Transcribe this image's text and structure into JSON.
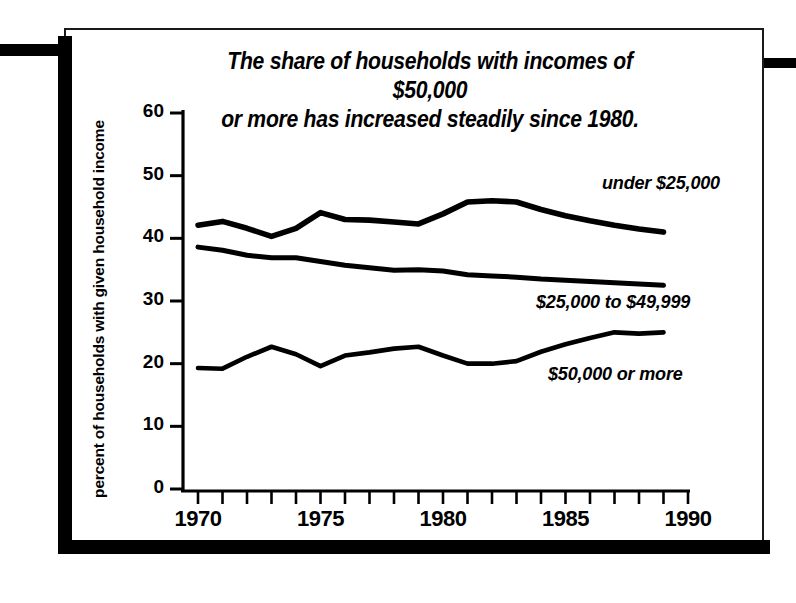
{
  "chart_data": {
    "type": "line",
    "title": "The share of households with incomes of $50,000 or more has increased steadily since 1980.",
    "title_line1": "The share of households with incomes of $50,000",
    "title_line2": "or more has increased steadily since 1980.",
    "xlabel": "",
    "ylabel": "percent of households with given household income",
    "xlim": [
      1970,
      1990
    ],
    "ylim": [
      0,
      60
    ],
    "grid": false,
    "legend_position": "inline-right",
    "x": [
      1970,
      1971,
      1972,
      1973,
      1974,
      1975,
      1976,
      1977,
      1978,
      1979,
      1980,
      1981,
      1982,
      1983,
      1984,
      1985,
      1986,
      1987,
      1988,
      1989
    ],
    "xtick_labels": [
      "1970",
      "1975",
      "1980",
      "1985",
      "1990"
    ],
    "xtick_values": [
      1970,
      1975,
      1980,
      1985,
      1990
    ],
    "ytick_labels": [
      "0",
      "10",
      "20",
      "30",
      "40",
      "50",
      "60"
    ],
    "ytick_values": [
      0,
      10,
      20,
      30,
      40,
      50,
      60
    ],
    "series": [
      {
        "name": "under $25,000",
        "label": "under $25,000",
        "color": "#000000",
        "values": [
          42.1,
          42.7,
          41.6,
          40.3,
          41.6,
          44.1,
          43.0,
          42.9,
          42.6,
          42.3,
          43.9,
          45.8,
          46.0,
          45.8,
          44.6,
          43.6,
          42.8,
          42.1,
          41.5,
          41.0
        ]
      },
      {
        "name": "$25,000 to $49,999",
        "label": "$25,000 to $49,999",
        "color": "#000000",
        "values": [
          38.6,
          38.1,
          37.3,
          36.9,
          36.9,
          36.3,
          35.7,
          35.3,
          34.9,
          35.0,
          34.8,
          34.2,
          34.0,
          33.8,
          33.5,
          33.3,
          33.1,
          32.9,
          32.7,
          32.5
        ]
      },
      {
        "name": "$50,000 or more",
        "label": "$50,000 or more",
        "color": "#000000",
        "values": [
          19.3,
          19.2,
          21.1,
          22.7,
          21.5,
          19.6,
          21.3,
          21.8,
          22.4,
          22.7,
          21.3,
          20.0,
          20.0,
          20.4,
          21.9,
          23.1,
          24.1,
          25.0,
          24.8,
          25.0
        ]
      }
    ],
    "annotations": [
      {
        "text": "under $25,000",
        "x": 1986.5,
        "y": 48.5
      },
      {
        "text": "$25,000 to $49,999",
        "x": 1983.8,
        "y": 29.5
      },
      {
        "text": "$50,000 or more",
        "x": 1984.3,
        "y": 18.0
      }
    ]
  }
}
